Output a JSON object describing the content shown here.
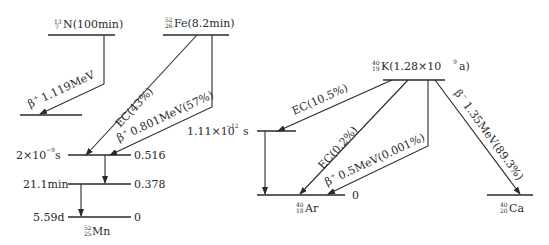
{
  "diagram": {
    "n13": {
      "parent_mass": "13",
      "parent_z": "7",
      "parent_symbol": "N(100min)",
      "transition_beta_plus": {
        "particle": "β",
        "sign": "+",
        "energy": "1.119MeV"
      }
    },
    "fe52": {
      "parent_mass": "52",
      "parent_z": "26",
      "parent_symbol": "Fe(8.2min)",
      "transition_ec": "EC(43%)",
      "transition_beta_plus": {
        "particle": "β",
        "sign": "+",
        "energy": "0.801MeV(57%)"
      }
    },
    "mn52": {
      "levels": [
        {
          "halflife": "2×10",
          "exp": "−9",
          "unit": "s",
          "energy": "0.516"
        },
        {
          "halflife": "21.1min",
          "energy": "0.378"
        },
        {
          "halflife": "5.59d",
          "energy": "0"
        }
      ],
      "daughter_mass": "52",
      "daughter_z": "25",
      "daughter_symbol": "Mn"
    },
    "k40": {
      "parent_mass": "40",
      "parent_z": "19",
      "parent_symbol_pre": "K(1.28×10",
      "parent_exp": "9",
      "parent_symbol_post": "a)",
      "transition_ec1": "EC(10.5%)",
      "transition_ec2": "EC(0.2%)",
      "transition_beta_plus": {
        "particle": "β",
        "sign": "+",
        "energy": "0.5MeV(0.001%)"
      },
      "transition_beta_minus": {
        "particle": "β",
        "sign": "−",
        "energy": "1.35MeV(89.3%)"
      },
      "excited_level": {
        "halflife": "1.11×10",
        "exp": "−12",
        "unit": "s"
      }
    },
    "ar40": {
      "daughter_mass": "40",
      "daughter_z": "18",
      "daughter_symbol": "Ar",
      "ground_energy": "0"
    },
    "ca40": {
      "daughter_mass": "40",
      "daughter_z": "20",
      "daughter_symbol": "Ca"
    }
  }
}
